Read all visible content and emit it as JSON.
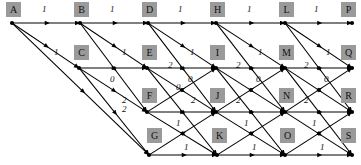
{
  "diagram": {
    "style": {
      "node_label_bg": "#9a9a9a",
      "edge_color": "#000000",
      "background": "#ffffff"
    },
    "nodes": [
      {
        "id": "A",
        "label": "A",
        "x": 12,
        "y": 23,
        "lx": 6,
        "ly": 2
      },
      {
        "id": "B",
        "label": "B",
        "x": 80,
        "y": 23,
        "lx": 74,
        "ly": 2
      },
      {
        "id": "D",
        "label": "D",
        "x": 148,
        "y": 23,
        "lx": 142,
        "ly": 2
      },
      {
        "id": "H",
        "label": "H",
        "x": 216,
        "y": 23,
        "lx": 210,
        "ly": 2
      },
      {
        "id": "L",
        "label": "L",
        "x": 285,
        "y": 23,
        "lx": 279,
        "ly": 2
      },
      {
        "id": "P",
        "label": "P",
        "x": 352,
        "y": 23,
        "lx": 341,
        "ly": 2
      },
      {
        "id": "C",
        "label": "C",
        "x": 79,
        "y": 68,
        "lx": 74,
        "ly": 45
      },
      {
        "id": "E",
        "label": "E",
        "x": 147,
        "y": 68,
        "lx": 142,
        "ly": 45
      },
      {
        "id": "I",
        "label": "I",
        "x": 216,
        "y": 68,
        "lx": 210,
        "ly": 45
      },
      {
        "id": "M",
        "label": "M",
        "x": 285,
        "y": 68,
        "lx": 279,
        "ly": 45
      },
      {
        "id": "Q",
        "label": "Q",
        "x": 352,
        "y": 68,
        "lx": 341,
        "ly": 45
      },
      {
        "id": "F",
        "label": "F",
        "x": 147,
        "y": 112,
        "lx": 142,
        "ly": 88
      },
      {
        "id": "J",
        "label": "J",
        "x": 216,
        "y": 112,
        "lx": 210,
        "ly": 88
      },
      {
        "id": "N",
        "label": "N",
        "x": 285,
        "y": 112,
        "lx": 279,
        "ly": 88
      },
      {
        "id": "R",
        "label": "R",
        "x": 352,
        "y": 112,
        "lx": 341,
        "ly": 88
      },
      {
        "id": "G",
        "label": "G",
        "x": 149,
        "y": 155,
        "lx": 147,
        "ly": 128
      },
      {
        "id": "K",
        "label": "K",
        "x": 217,
        "y": 155,
        "lx": 212,
        "ly": 128
      },
      {
        "id": "O",
        "label": "O",
        "x": 285,
        "y": 155,
        "lx": 280,
        "ly": 128
      },
      {
        "id": "S",
        "label": "S",
        "x": 352,
        "y": 155,
        "lx": 341,
        "ly": 128
      }
    ],
    "edges": [
      {
        "from": "A",
        "to": "B",
        "weight": "1"
      },
      {
        "from": "A",
        "to": "C",
        "weight": "1"
      },
      {
        "from": "A",
        "to": "G",
        "weight": ""
      },
      {
        "from": "B",
        "to": "D",
        "weight": "1"
      },
      {
        "from": "B",
        "to": "E",
        "weight": "1"
      },
      {
        "from": "B",
        "to": "F",
        "weight": "2"
      },
      {
        "from": "C",
        "to": "E",
        "weight": ""
      },
      {
        "from": "C",
        "to": "F",
        "weight": "0"
      },
      {
        "from": "C",
        "to": "G",
        "weight": "2"
      },
      {
        "from": "D",
        "to": "H",
        "weight": "1"
      },
      {
        "from": "D",
        "to": "I",
        "weight": "1"
      },
      {
        "from": "D",
        "to": "J",
        "weight": ""
      },
      {
        "from": "E",
        "to": "I",
        "weight": "2"
      },
      {
        "from": "E",
        "to": "J",
        "weight": "0"
      },
      {
        "from": "E",
        "to": "K",
        "weight": ""
      },
      {
        "from": "F",
        "to": "I",
        "weight": ""
      },
      {
        "from": "F",
        "to": "J",
        "weight": "2"
      },
      {
        "from": "F",
        "to": "K",
        "weight": ""
      },
      {
        "from": "G",
        "to": "J",
        "weight": "1"
      },
      {
        "from": "G",
        "to": "K",
        "weight": "1"
      },
      {
        "from": "H",
        "to": "L",
        "weight": "1"
      },
      {
        "from": "H",
        "to": "M",
        "weight": "1"
      },
      {
        "from": "H",
        "to": "N",
        "weight": ""
      },
      {
        "from": "I",
        "to": "M",
        "weight": "2"
      },
      {
        "from": "I",
        "to": "N",
        "weight": "0"
      },
      {
        "from": "I",
        "to": "O",
        "weight": ""
      },
      {
        "from": "J",
        "to": "M",
        "weight": ""
      },
      {
        "from": "J",
        "to": "N",
        "weight": "2"
      },
      {
        "from": "J",
        "to": "O",
        "weight": ""
      },
      {
        "from": "K",
        "to": "N",
        "weight": "1"
      },
      {
        "from": "K",
        "to": "O",
        "weight": "1"
      },
      {
        "from": "L",
        "to": "P",
        "weight": "1"
      },
      {
        "from": "L",
        "to": "Q",
        "weight": "1"
      },
      {
        "from": "L",
        "to": "R",
        "weight": ""
      },
      {
        "from": "M",
        "to": "Q",
        "weight": "2"
      },
      {
        "from": "M",
        "to": "R",
        "weight": "0"
      },
      {
        "from": "M",
        "to": "S",
        "weight": ""
      },
      {
        "from": "N",
        "to": "Q",
        "weight": ""
      },
      {
        "from": "N",
        "to": "R",
        "weight": "2"
      },
      {
        "from": "N",
        "to": "S",
        "weight": ""
      },
      {
        "from": "O",
        "to": "R",
        "weight": "1"
      },
      {
        "from": "O",
        "to": "S",
        "weight": "1"
      }
    ],
    "edge_labels": [
      {
        "text": "1",
        "x": 42,
        "y": 4
      },
      {
        "text": "1",
        "x": 110,
        "y": 4
      },
      {
        "text": "1",
        "x": 178,
        "y": 4
      },
      {
        "text": "1",
        "x": 247,
        "y": 4
      },
      {
        "text": "1",
        "x": 314,
        "y": 4
      },
      {
        "text": "1",
        "x": 54,
        "y": 47
      },
      {
        "text": "1",
        "x": 122,
        "y": 47
      },
      {
        "text": "1",
        "x": 190,
        "y": 47
      },
      {
        "text": "1",
        "x": 258,
        "y": 47
      },
      {
        "text": "1",
        "x": 326,
        "y": 47
      },
      {
        "text": "0",
        "x": 110,
        "y": 74
      },
      {
        "text": "2",
        "x": 168,
        "y": 60
      },
      {
        "text": "0",
        "x": 188,
        "y": 74
      },
      {
        "text": "2",
        "x": 236,
        "y": 60
      },
      {
        "text": "0",
        "x": 256,
        "y": 74
      },
      {
        "text": "2",
        "x": 304,
        "y": 60
      },
      {
        "text": "0",
        "x": 324,
        "y": 74
      },
      {
        "text": "2",
        "x": 122,
        "y": 95
      },
      {
        "text": "0",
        "x": 176,
        "y": 82
      },
      {
        "text": "2",
        "x": 191,
        "y": 95
      },
      {
        "text": "2",
        "x": 236,
        "y": 95
      },
      {
        "text": "2",
        "x": 304,
        "y": 95
      },
      {
        "text": "1",
        "x": 176,
        "y": 118
      },
      {
        "text": "1",
        "x": 244,
        "y": 118
      },
      {
        "text": "1",
        "x": 312,
        "y": 118
      },
      {
        "text": "2",
        "x": 122,
        "y": 104
      },
      {
        "text": "1",
        "x": 184,
        "y": 142
      },
      {
        "text": "1",
        "x": 252,
        "y": 142
      },
      {
        "text": "1",
        "x": 320,
        "y": 142
      }
    ]
  }
}
